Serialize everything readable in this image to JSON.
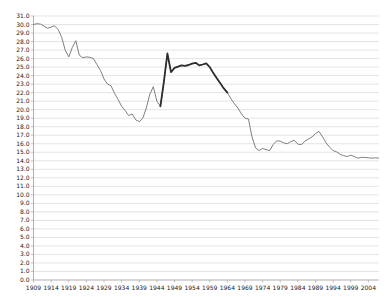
{
  "chart_data": {
    "type": "line",
    "title": "",
    "xlabel": "",
    "ylabel": "",
    "grid": true,
    "legend": "none",
    "ylim": [
      0,
      31
    ],
    "ytick_step": 1,
    "ytick_labels": [
      "0.0",
      "1.0",
      "2.0",
      "3.0",
      "4.0",
      "5.0",
      "6.0",
      "7.0",
      "8.0",
      "9.0",
      "10.0",
      "11.0",
      "12.0",
      "13.0",
      "14.0",
      "15.0",
      "16.0",
      "17.0",
      "18.0",
      "19.0",
      "20.0",
      "21.0",
      "22.0",
      "23.0",
      "24.0",
      "25.0",
      "26.0",
      "27.0",
      "28.0",
      "29.0",
      "30.0",
      "31.0"
    ],
    "xtick_labels": [
      "1909",
      "1914",
      "1919",
      "1924",
      "1929",
      "1934",
      "1939",
      "1944",
      "1949",
      "1954",
      "1959",
      "1964",
      "1969",
      "1974",
      "1979",
      "1984",
      "1989",
      "1994",
      "1999",
      "2004"
    ],
    "x_start": 1909,
    "x_end": 2007,
    "series": [
      {
        "name": "main-line",
        "values": [
          30.0,
          30.1,
          30.05,
          29.8,
          29.55,
          29.7,
          29.85,
          29.4,
          28.5,
          27.0,
          26.2,
          27.3,
          28.1,
          26.4,
          26.1,
          26.2,
          26.15,
          26.0,
          25.3,
          24.6,
          23.6,
          23.0,
          22.8,
          21.9,
          21.2,
          20.4,
          19.9,
          19.3,
          19.5,
          18.8,
          18.6,
          19.0,
          20.2,
          21.8,
          22.7,
          21.0,
          20.4,
          23.3,
          26.6,
          24.4,
          24.9,
          25.05,
          25.2,
          25.15,
          25.25,
          25.4,
          25.5,
          25.2,
          25.3,
          25.45,
          25.0,
          24.3,
          23.7,
          23.1,
          22.5,
          22.0,
          21.3,
          20.7,
          20.2,
          19.5,
          19.0,
          18.9,
          16.8,
          15.5,
          15.2,
          15.45,
          15.3,
          15.2,
          15.9,
          16.35,
          16.3,
          16.1,
          16.0,
          16.25,
          16.4,
          15.95,
          15.9,
          16.3,
          16.55,
          16.8,
          17.2,
          17.45,
          16.8,
          16.1,
          15.6,
          15.2,
          15.05,
          14.75,
          14.6,
          14.5,
          14.65,
          14.5,
          14.3,
          14.4,
          14.4,
          14.35,
          14.3,
          14.35,
          14.3
        ]
      }
    ],
    "highlight_segment": {
      "from_year": 1945,
      "to_year": 1964
    },
    "colors": {
      "gridline": "#d9d9d9",
      "axis": "#a6a6a6",
      "line": "#7f7f7f",
      "highlight": "#2e2e2e",
      "tick_text": "#1a1a1a",
      "background": "#ffffff"
    }
  }
}
